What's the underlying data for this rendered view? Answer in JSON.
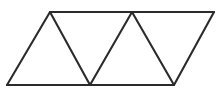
{
  "figure": {
    "shape_type": "geometric-line-diagram",
    "background_color": "#ffffff",
    "line_color": "#2b2b2b",
    "line_width": 2.1,
    "canvas": {
      "width": 221,
      "height": 102
    },
    "triangle_count": 4,
    "vertices": {
      "top": [
        {
          "name": "T1",
          "x": 50,
          "y": 12
        },
        {
          "name": "T2",
          "x": 132,
          "y": 12
        },
        {
          "name": "T3",
          "x": 214,
          "y": 12
        }
      ],
      "bottom": [
        {
          "name": "B1",
          "x": 7,
          "y": 85
        },
        {
          "name": "B2",
          "x": 90,
          "y": 85
        },
        {
          "name": "B3",
          "x": 174,
          "y": 85
        }
      ]
    },
    "edges": [
      {
        "name": "top-edge",
        "from": [
          50,
          12
        ],
        "to": [
          214,
          12
        ]
      },
      {
        "name": "bottom-edge",
        "from": [
          7,
          85
        ],
        "to": [
          174,
          85
        ]
      },
      {
        "name": "left-slant-edge",
        "from": [
          7,
          85
        ],
        "to": [
          50,
          12
        ]
      },
      {
        "name": "right-slant-edge",
        "from": [
          174,
          85
        ],
        "to": [
          214,
          12
        ]
      },
      {
        "name": "interior-segment-1",
        "from": [
          50,
          12
        ],
        "to": [
          90,
          85
        ]
      },
      {
        "name": "interior-segment-2",
        "from": [
          90,
          85
        ],
        "to": [
          132,
          12
        ]
      },
      {
        "name": "interior-segment-3",
        "from": [
          132,
          12
        ],
        "to": [
          174,
          85
        ]
      }
    ]
  }
}
